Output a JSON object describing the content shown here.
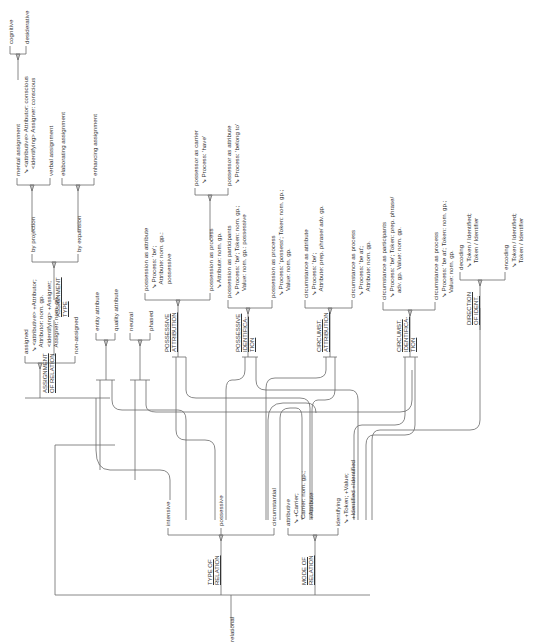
{
  "diagram": {
    "type": "system network (rotated 90° counter-clockwise)",
    "entry": "relational",
    "systems": {
      "type_of_relation": {
        "name": "TYPE OF RELATION",
        "options": [
          "intensive",
          "possessive",
          "circumstantial"
        ]
      },
      "mode_of_relation": {
        "name": "MODE OF RELATION",
        "options": [
          {
            "label": "attributive",
            "realization": "↘ +Carrier; Carrier: nom. gp.; +Attribute"
          },
          {
            "label": "identifying",
            "realization": "↘ +Token; +Value; +Identified +Identifier"
          }
        ]
      },
      "assignment_of_relation": {
        "name": "ASSIGNMENT OF RELATION",
        "options": [
          {
            "label": "assigned",
            "realization": "↘ <attributive> +Attributor; Attributor: nom. gp. <identifying> +Assigner; Assigner: nom. gp."
          },
          {
            "label": "non-assigned"
          }
        ]
      },
      "assignment_type": {
        "name": "ASSIGNMENT TYPE",
        "options": [
          "by projection",
          "by expansion"
        ]
      },
      "projection": {
        "options": [
          {
            "label": "mental assignment",
            "realization": "↘ <attributive> Attributor: conscious <identifying> Assigner: conscious"
          },
          {
            "label": "verbal assignment"
          }
        ]
      },
      "mental_type": {
        "options": [
          "cognitive",
          "desiderative"
        ]
      },
      "expansion": {
        "options": [
          "elaborating assignment",
          "enhancing assignment"
        ]
      },
      "attribute_type": {
        "options": [
          "entity attribute",
          "quality attribute"
        ]
      },
      "phase": {
        "options": [
          "neutral",
          "phased"
        ]
      },
      "possessive_attribution": {
        "name": "POSSESSIVE ATTRIBUTION",
        "options": [
          {
            "label": "possession as attribute",
            "realization": "↘ Process: 'be'; Attribute: nom. gp.: possessive"
          },
          {
            "label": "possession as process",
            "realization": "↘ Attribute: nom. gp."
          }
        ]
      },
      "possession_process": {
        "options": [
          {
            "label": "possessor as carrier",
            "realization": "↘ Process: 'have'"
          },
          {
            "label": "possessor as attribute",
            "realization": "↘ Process: 'belong to'"
          }
        ]
      },
      "possessive_identification": {
        "name": "POSSESSIVE IDENTIFICATION",
        "options": [
          {
            "label": "possession as participants",
            "realization": "↘ Process: 'be'; Token: nom. gp.; Value: nom. gp.: possessive"
          },
          {
            "label": "possession as process",
            "realization": "↘ Process: 'possess'; Token: nom. gp.; Value: nom. gp."
          }
        ]
      },
      "circumst_attribution": {
        "name": "CIRCUMST. ATTRIBUTION",
        "options": [
          {
            "label": "circumstance as attribute",
            "realization": "↘ Process: 'be'; Attribute: prep. phrase/ adv. gp."
          },
          {
            "label": "circumstance as process",
            "realization": "↘ Process: 'be at'; Attribute: nom. gp."
          }
        ]
      },
      "circumst_identification": {
        "name": "CIRCUMST. IDENTIFICATION",
        "options": [
          {
            "label": "circumstance as participants",
            "realization": "↘ Process: 'be'; Token: prep. phrase/ adv. gp. Value: nom. gp."
          },
          {
            "label": "circumstance as process",
            "realization": "↘ Process: 'be at'; Token: nom. gp.; Value: nom. gp."
          }
        ]
      },
      "direction_of_ident": {
        "name": "DIRECTION OF IDENT.",
        "options": [
          {
            "label": "decoding",
            "realization": "↘ Token / Identified; Token / Identifier"
          },
          {
            "label": "encoding",
            "realization": "↘ Token / Identified; Token / Identifier"
          }
        ]
      }
    }
  },
  "labels": {
    "relational": "relational",
    "type_of_relation": "TYPE OF\nRELATION",
    "mode_of_relation": "MODE OF\nRELATION",
    "intensive": "intensive",
    "possessive": "possessive",
    "circumstantial": "circumstantial",
    "attributive": "attributive\n ↘ +Carrier;\n    Carrier: nom. gp.;\n    +Attribute",
    "identifying": "identifying\n ↘ +Token; +Value;\n    +Identified +Identified",
    "assignment_of_relation": "ASSIGNMENT\nOF RELATION",
    "assigned": "assigned\n ↘ <attributive> +Attributor;\n    Attributor: nom. gp.\n    <identifying> +Assigner;\n    Assigner: nom. gp.",
    "non_assigned": "non-assigned",
    "assignment_type": "ASSIGNMENT\nTYPE",
    "by_projection": "by projection",
    "by_expansion": "by expansion",
    "mental_assignment": "mental assignment\n ↘ <attributive> Attributor: conscious\n    <identifying> Assigner: conscious",
    "verbal_assignment": "verbal assignment",
    "elaborating_assignment": "elaborating assignment",
    "enhancing_assignment": "enhancing assignment",
    "cognitive": "cognitive",
    "desiderative": "desiderative",
    "entity_attribute": "entity attribute",
    "quality_attribute": "quality attribute",
    "neutral": "neutral",
    "phased": "phased",
    "possessive_attribution": "POSSESSIVE\nATTRIBUTION",
    "possession_as_attribute": "possession as attribute\n ↘ Process: 'be';\n    Attribute: nom. gp.:\n    possessive",
    "possession_as_process_attr": "possession as process\n ↘ Attribute: nom. gp.",
    "possessor_as_carrier": "possessor as carrier\n ↘ Process: 'have'",
    "possessor_as_attribute": "possessor as attribute\n ↘ Process: 'belong to'",
    "possessive_identification": "POSSESSIVE\nIDENTIFICA-\nTION",
    "possession_as_participants": "possession as participants\n ↘ Process: 'be'; Token: nom. gp.;\n    Value: nom. gp.: possessive",
    "possession_as_process_ident": "possession as process\n ↘ Process: 'possess'; Token: nom. gp.;\n    Value: nom. gp.",
    "circumst_attribution": "CIRCUMST.\nATTRIBUTION",
    "circumstance_as_attribute": "circumstance as attribute\n ↘ Process: 'be';\n    Attribute: prep. phrase/ adv. gp.",
    "circumstance_as_process_attr": "circumstance as process\n ↘ Process: 'be at';\n    Attribute: nom. gp.",
    "circumst_identification": "CIRCUMST.\nIDENTIFICA-\nTION",
    "circumstance_as_participants": "circumstance as participants\n ↘ Process: 'be'; Token: prep. phrase/\n    adv. gp. Value: nom. gp.",
    "circumstance_as_process_ident": "circumstance as process\n ↘ Process: 'be at'; Token: nom. gp.;\n    Value: nom. gp.",
    "direction_of_ident": "DIRECTION\nOF IDENT.",
    "decoding": "decoding\n ↘ Token / Identified;\n    Token / Identifier",
    "encoding": "encoding\n ↘ Token / Identified;\n    Token / Identifier"
  }
}
